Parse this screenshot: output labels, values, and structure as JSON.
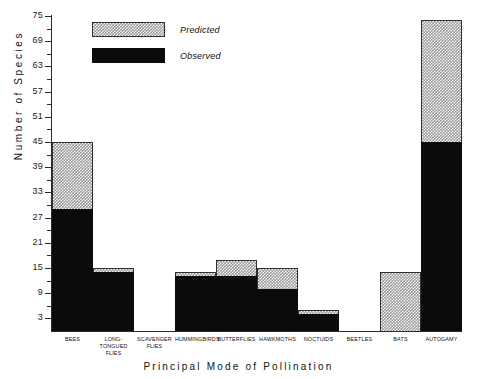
{
  "chart_data": {
    "type": "bar",
    "stacked": true,
    "title": "",
    "xlabel": "Principal Mode of Pollination",
    "ylabel": "Number of Species",
    "ylim": [
      0,
      75
    ],
    "yticks": [
      3,
      9,
      15,
      21,
      27,
      33,
      39,
      45,
      51,
      57,
      63,
      69,
      75
    ],
    "ytick_step": 6,
    "grid": false,
    "legend_position": "top-left",
    "categories": [
      "BEES",
      "LONG-TONGUED FLIES",
      "SCAVENGER FLIES",
      "HUMMINGBIRDS",
      "BUTTERFLIES",
      "HAWKMOTHS",
      "NOCTUIDS",
      "BEETLES",
      "BATS",
      "AUTOGAMY"
    ],
    "series": [
      {
        "name": "Observed",
        "color": "#0b0b0b",
        "values": [
          29,
          14,
          0,
          13,
          13,
          10,
          4,
          0,
          0,
          45
        ]
      },
      {
        "name": "Predicted",
        "color": "#9a9a9a",
        "values": [
          45,
          15,
          0,
          14,
          17,
          15,
          5,
          0,
          14,
          74
        ]
      }
    ]
  },
  "axes": {
    "y_title": "Number of Species",
    "x_title": "Principal Mode of Pollination",
    "y_tick_labels": [
      "75",
      "69",
      "63",
      "57",
      "51",
      "45",
      "39",
      "33",
      "27",
      "21",
      "15",
      "9",
      "3"
    ]
  },
  "legend": {
    "items": [
      {
        "label": "Predicted",
        "swatch": "hatched-gray"
      },
      {
        "label": "Observed",
        "swatch": "solid-black"
      }
    ]
  },
  "x_labels": [
    {
      "line1": "BEES",
      "line2": ""
    },
    {
      "line1": "LONG-TONGUED",
      "line2": "FLIES"
    },
    {
      "line1": "SCAVENGER",
      "line2": "FLIES"
    },
    {
      "line1": "HUMMINGBIRDS",
      "line2": ""
    },
    {
      "line1": "BUTTERFLIES",
      "line2": ""
    },
    {
      "line1": "HAWKMOTHS",
      "line2": ""
    },
    {
      "line1": "NOCTUIDS",
      "line2": ""
    },
    {
      "line1": "BEETLES",
      "line2": ""
    },
    {
      "line1": "BATS",
      "line2": ""
    },
    {
      "line1": "AUTOGAMY",
      "line2": ""
    }
  ]
}
